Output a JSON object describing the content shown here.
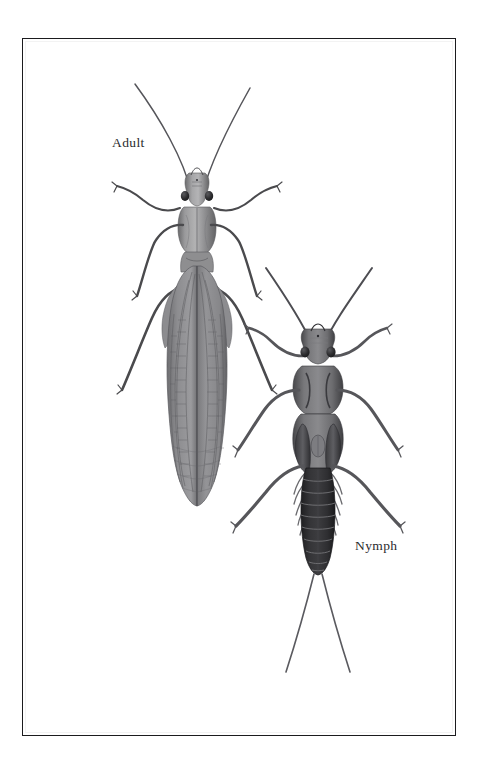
{
  "plate": {
    "title": "Stonefly life stages plate",
    "subject": "stonefly (Plecoptera) scientific illustration",
    "background_color": "#ffffff",
    "frame": {
      "border_color": "#1b1b1e",
      "fill_color": "#ffffff",
      "x": 22,
      "y": 38,
      "width": 434,
      "height": 698
    }
  },
  "labels": {
    "adult": "Adult",
    "nymph": "Nymph",
    "text_color": "#2b2b2e"
  },
  "figures": [
    {
      "name": "adult-stonefly",
      "label": "Adult",
      "orientation": "dorsal view, head up",
      "center_x": 197,
      "head_y": 196,
      "total_height_px": 420,
      "palette": {
        "body": "#8f8f90",
        "body_shadow": "#5e5e60",
        "body_highlight": "#b3b3b4",
        "wing": "#8a8a8c",
        "wing_vein": "#5d5d60",
        "eye": "#2a2a2c",
        "leg": "#4a4a4d",
        "antenna": "#55555a"
      },
      "parts": [
        "antennae (long, paired, V-splayed)",
        "head with compound eyes and ocelli",
        "pronotum (trapezoidal)",
        "folded forewings with venation reaching past abdomen tip",
        "three pairs of legs",
        "short cerci hidden under wings"
      ]
    },
    {
      "name": "nymph-stonefly",
      "label": "Nymph",
      "orientation": "dorsal view, head up",
      "center_x": 318,
      "head_y": 345,
      "total_height_px": 400,
      "palette": {
        "body": "#6d6d70",
        "body_shadow": "#3c3c3f",
        "abdomen": "#2c2c2e",
        "abdomen_line": "#77777a",
        "wingpad": "#58585c",
        "eye": "#222224",
        "leg": "#56565a",
        "antenna": "#4d4d52",
        "cercus": "#5a5a5f",
        "gill": "#6a6a6e"
      },
      "parts": [
        "antennae (thick, paired, splayed)",
        "head with eyes",
        "pronotum",
        "mesothorax and metathorax with dark wing pads",
        "ten dark segmented abdominal segments",
        "lateral gill filaments along abdomen",
        "two long curved cerci (tails)",
        "three pairs of sprawling legs"
      ]
    }
  ]
}
